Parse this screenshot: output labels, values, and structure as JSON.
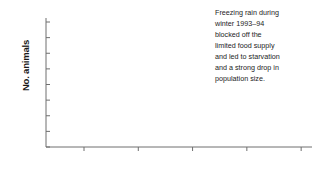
{
  "chart_data": {
    "type": "line",
    "title": "",
    "xlabel": "",
    "ylabel": "No. animals",
    "xlim": [
      1976.5,
      2001
    ],
    "ylim": [
      0,
      400
    ],
    "grid": false,
    "legend": "none",
    "marker": "circle",
    "x": [
      1977,
      1978,
      1979,
      1980,
      1981,
      1982,
      1983,
      1984,
      1985,
      1986,
      1987,
      1988,
      1989,
      1990,
      1991,
      1992,
      1993,
      1994,
      1995,
      1996,
      1997,
      1998
    ],
    "values": [
      12,
      16,
      20,
      20,
      30,
      38,
      46,
      52,
      80,
      102,
      125,
      140,
      208,
      215,
      233,
      301,
      360,
      85,
      104,
      96,
      118,
      172
    ],
    "xticks": [
      1980,
      1985,
      1990,
      1995,
      2000
    ],
    "yticks": [
      0,
      50,
      100,
      150,
      200,
      250,
      300,
      350,
      400
    ]
  },
  "annotation": {
    "text": "Freezing rain during\nwinter 1993–94\nblocked off the\nlimited food supply\nand led to starvation\nand a strong drop in\npopulation size.",
    "points_to_year": 1994,
    "points_to_value": 85
  },
  "colors": {
    "series": "#8b9099",
    "marker": "#848a93",
    "axis": "#6e6e6e",
    "text": "#1a1a1a",
    "callout_fill": "#d9d9d9",
    "callout_stroke": "#8f8f8f",
    "background": "#ffffff"
  }
}
